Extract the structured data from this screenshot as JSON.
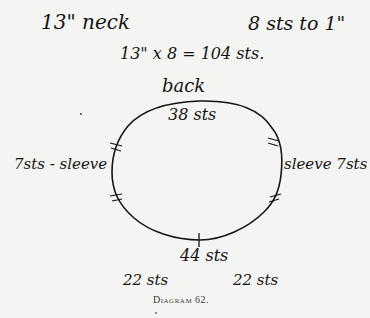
{
  "header": {
    "neck_label": "13\" neck",
    "gauge_label": "8 sts to 1\"",
    "calculation": "13\" x 8 = 104 sts."
  },
  "diagram": {
    "back_label": "back",
    "top_stitches": "38 sts",
    "left_label": "7sts - sleeve",
    "right_label": "sleeve 7sts",
    "bottom_stitches": "44 sts",
    "bottom_left_split": "22 sts",
    "bottom_right_split": "22 sts",
    "shape": "oval",
    "markers": [
      "left-upper",
      "left-lower",
      "right-upper",
      "right-lower",
      "bottom-center"
    ]
  },
  "caption": "Diagram 62."
}
